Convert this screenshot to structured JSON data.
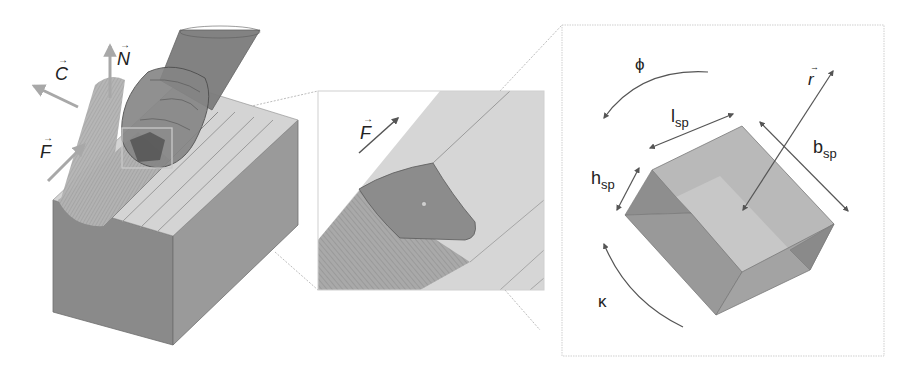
{
  "figure": {
    "panels": [
      {
        "id": "overview",
        "description": "Tool cutting a groove in workpiece"
      },
      {
        "id": "zoom-contact",
        "description": "Zoomed contact region of tool tip"
      },
      {
        "id": "voxel-detail",
        "description": "Swept prism element with parameters"
      }
    ]
  },
  "overview": {
    "vectors": {
      "C": {
        "symbol": "C",
        "arrow": "→"
      },
      "N": {
        "symbol": "N",
        "arrow": "→"
      },
      "F": {
        "symbol": "F",
        "arrow": "→"
      }
    }
  },
  "zoom_panel": {
    "vector_F": {
      "symbol": "F",
      "arrow": "→"
    }
  },
  "detail_panel": {
    "phi": "ϕ",
    "kappa": "κ",
    "l_sp": {
      "base": "l",
      "sub": "sp"
    },
    "b_sp": {
      "base": "b",
      "sub": "sp"
    },
    "h_sp": {
      "base": "h",
      "sub": "sp"
    },
    "r": {
      "symbol": "r",
      "arrow": "→"
    }
  },
  "colors": {
    "vector_arrow": "#a8a8a8",
    "workpiece_front": "#8a8a8a",
    "workpiece_side": "#9a9a9a",
    "workpiece_top": "#d4d4d4",
    "tool_body": "#7c7c7c",
    "prism_top": "#b9b9b9",
    "prism_face": "#999999",
    "dimension_line": "#555555",
    "panel_border": "#c8c8c8"
  }
}
